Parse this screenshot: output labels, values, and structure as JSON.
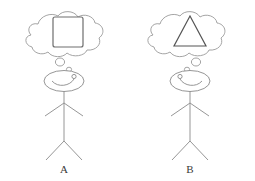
{
  "figure": {
    "title": "",
    "background_color": "#ffffff",
    "line_color": "#8a8a8a",
    "shape_line_color": "#6e6e6e",
    "label_color": "#3a3a3a"
  },
  "panels": [
    {
      "id": "panel-a",
      "label": "A",
      "thought_shape": "square",
      "thought_shape_name": "square-shape",
      "bubble_side": "right",
      "face": {
        "eye_side": "right",
        "expression": "smile"
      }
    },
    {
      "id": "panel-b",
      "label": "B",
      "thought_shape": "triangle",
      "thought_shape_name": "triangle-shape",
      "bubble_side": "left",
      "face": {
        "eye_side": "left",
        "expression": "smile"
      }
    }
  ]
}
